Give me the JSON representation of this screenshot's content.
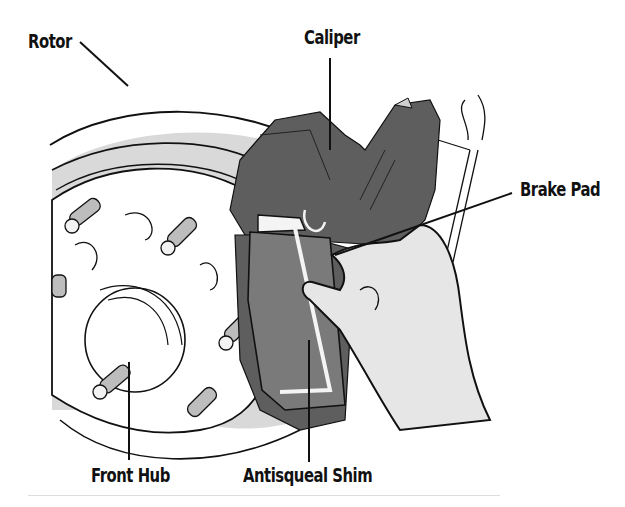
{
  "figure": {
    "labels": {
      "rotor": "Rotor",
      "caliper": "Caliper",
      "brake_pad": "Brake Pad",
      "front_hub": "Front Hub",
      "antisqueal_shim": "Antisqueal Shim"
    },
    "colors": {
      "rotor_fill": "#d9d9d9",
      "hub_fill": "#ffffff",
      "caliper_fill": "#5e5e5e",
      "pad_fill": "#7a7a7a",
      "shim_fill": "#f4f4f4",
      "hand_fill": "#e6e6e6",
      "outline": "#111111",
      "bottom_rule": "#dddddd"
    }
  }
}
